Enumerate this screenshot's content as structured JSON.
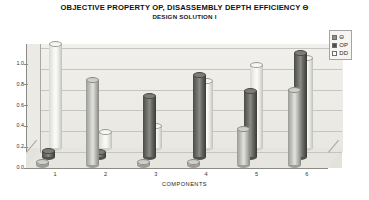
{
  "title": {
    "line1": "OBJECTIVE PROPERTY OP, DISASSEMBLY DEPTH EFFICIENCY Θ",
    "line2": "DESIGN SOLUTION I"
  },
  "legend": {
    "position": "top-right",
    "items": [
      {
        "label": "Θ",
        "color": "#8f8f8a"
      },
      {
        "label": "OP",
        "color": "#4e4e4b"
      },
      {
        "label": "DD",
        "color": "#fbfbf9"
      }
    ]
  },
  "axes": {
    "x_title": "COMPONENTS",
    "y_ticks": [
      "1.0",
      "0.8",
      "0.6",
      "0.4",
      "0.2",
      "0.0"
    ],
    "x_ticks": [
      "1",
      "2",
      "3",
      "4",
      "5",
      "6"
    ]
  },
  "chart_data": {
    "type": "bar",
    "title": "OBJECTIVE PROPERTY OP, DISASSEMBLY DEPTH EFFICIENCY Θ",
    "subtitle": "DESIGN SOLUTION I",
    "xlabel": "COMPONENTS",
    "ylabel": "",
    "ylim": [
      0.0,
      1.0
    ],
    "grid": true,
    "legend_position": "top-right",
    "categories": [
      "1",
      "2",
      "3",
      "4",
      "5",
      "6"
    ],
    "series": [
      {
        "name": "Θ",
        "color": "#8f8f8a",
        "values": [
          0.03,
          0.82,
          0.03,
          0.03,
          0.35,
          0.72
        ]
      },
      {
        "name": "OP",
        "color": "#4e4e4b",
        "values": [
          0.05,
          0.04,
          0.58,
          0.78,
          0.63,
          1.0
        ]
      },
      {
        "name": "DD",
        "color": "#fbfbf9",
        "values": [
          1.0,
          0.15,
          0.21,
          0.64,
          0.8,
          0.87
        ]
      }
    ]
  }
}
